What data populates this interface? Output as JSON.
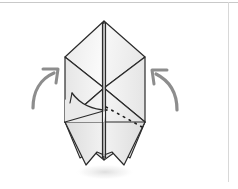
{
  "figure": {
    "title": "Origami fold step diagram",
    "canvas": {
      "width": 238,
      "height": 189
    },
    "colors": {
      "background": "#ffffff",
      "paper_light": "#f7f7f7",
      "paper_mid": "#efefef",
      "paper_shade": "#e4e4e4",
      "paper_dark": "#d9d9d9",
      "outline": "#2b2b2b",
      "crease": "#3a3a3a",
      "hidden_crease": "#1f1f1f",
      "arrow": "#8d8d8d",
      "frame": "#c9c9c9",
      "shadow": "#ededed"
    },
    "model": {
      "apex": {
        "x": 104,
        "y": 21
      },
      "left_shoulder": {
        "x": 65,
        "y": 57
      },
      "right_shoulder": {
        "x": 145,
        "y": 57
      },
      "left_waist": {
        "x": 65,
        "y": 122
      },
      "right_waist": {
        "x": 145,
        "y": 122
      },
      "center_mid": {
        "x": 104,
        "y": 88
      },
      "bottom_left_tip": {
        "x": 86,
        "y": 165
      },
      "bottom_right_tip": {
        "x": 124,
        "y": 165
      },
      "center_line_top": {
        "x": 104,
        "y": 21
      },
      "center_line_bottom": {
        "x": 104,
        "y": 160
      }
    },
    "hidden_crease": {
      "style": "dashed",
      "from": {
        "x": 104,
        "y": 107
      },
      "to": {
        "x": 142,
        "y": 127
      }
    },
    "curved_fold": {
      "style": "solid-curve",
      "from": {
        "x": 72,
        "y": 94
      },
      "to": {
        "x": 106,
        "y": 110
      }
    },
    "arrows": [
      {
        "name": "left-fold-arrow",
        "label": "fold up left side",
        "direction": "up-right",
        "tail": {
          "x": 33,
          "y": 106
        },
        "head": {
          "x": 57,
          "y": 72
        }
      },
      {
        "name": "right-fold-arrow",
        "label": "fold up right side",
        "direction": "up-left",
        "tail": {
          "x": 176,
          "y": 108
        },
        "head": {
          "x": 152,
          "y": 72
        }
      }
    ]
  }
}
